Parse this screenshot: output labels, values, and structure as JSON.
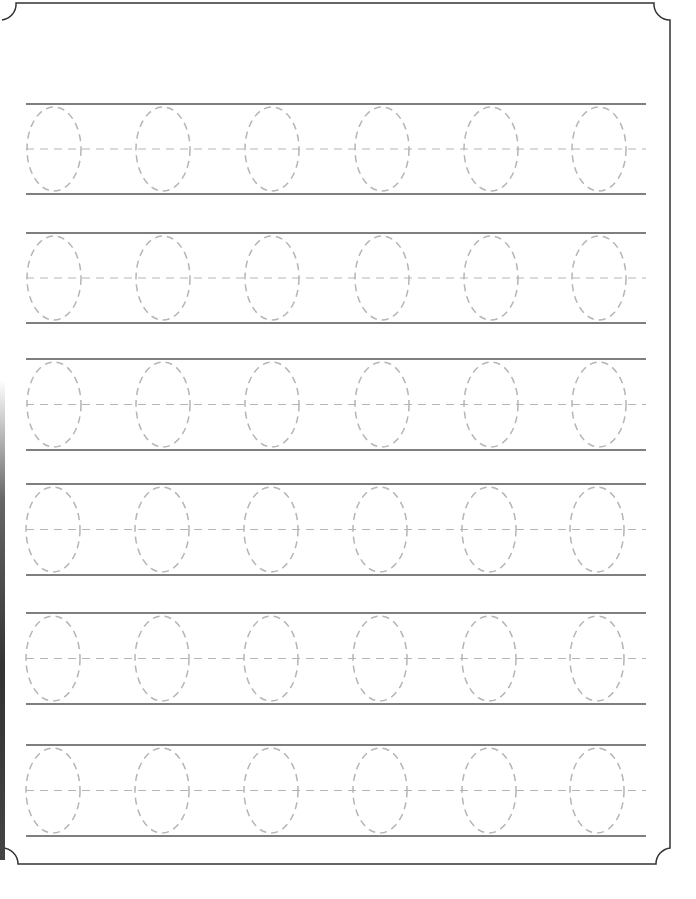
{
  "worksheet": {
    "type": "tracing practice",
    "letter": "0",
    "rows": 6,
    "glyphs_per_row": 6,
    "border": {
      "stroke": "#333333",
      "corner_style": "concave scallop"
    },
    "colors": {
      "rule_line": "#555555",
      "trace_dash": "#b5b5b5",
      "background": "#ffffff"
    },
    "row_layout": [
      {
        "top": 104,
        "bottom": 194,
        "glyph_centers_x": [
          54,
          163,
          272,
          382,
          491,
          599
        ]
      },
      {
        "top": 233,
        "bottom": 323,
        "glyph_centers_x": [
          54,
          163,
          272,
          382,
          491,
          599
        ]
      },
      {
        "top": 359,
        "bottom": 450,
        "glyph_centers_x": [
          54,
          163,
          272,
          382,
          491,
          599
        ]
      },
      {
        "top": 484,
        "bottom": 575,
        "glyph_centers_x": [
          53,
          162,
          271,
          380,
          489,
          597
        ]
      },
      {
        "top": 613,
        "bottom": 704,
        "glyph_centers_x": [
          53,
          162,
          271,
          380,
          489,
          597
        ]
      },
      {
        "top": 745,
        "bottom": 836,
        "glyph_centers_x": [
          53,
          162,
          271,
          380,
          489,
          597
        ]
      }
    ]
  }
}
